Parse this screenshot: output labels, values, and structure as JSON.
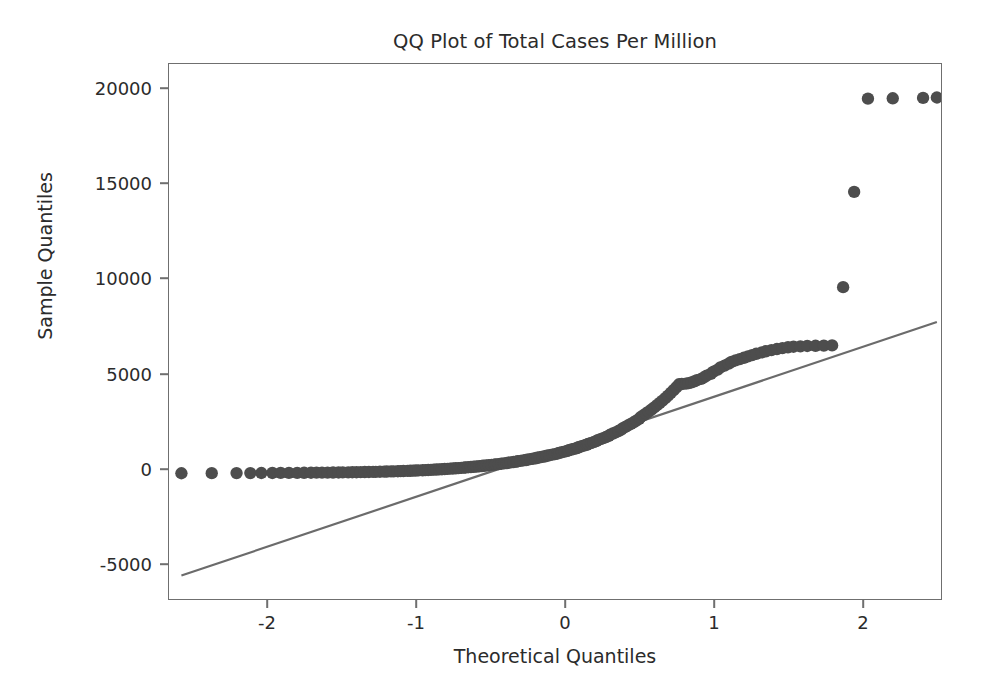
{
  "chart_data": {
    "type": "scatter",
    "title": "QQ Plot of Total Cases Per Million",
    "xlabel": "Theoretical Quantiles",
    "ylabel": "Sample Quantiles",
    "xlim": [
      -2.78,
      2.82
    ],
    "ylim": [
      -6600,
      21500
    ],
    "grid": false,
    "legend": null,
    "marker_color": "#4d4d4d",
    "line_color": "#6b6b6b",
    "xticks": [
      -2,
      -1,
      0,
      1,
      2
    ],
    "xtick_labels": [
      "-2",
      "-1",
      "0",
      "1",
      "2"
    ],
    "yticks": [
      -5000,
      0,
      5000,
      10000,
      15000,
      20000
    ],
    "ytick_labels": [
      "-5000",
      "0",
      "5000",
      "10000",
      "15000",
      "20000"
    ],
    "reference_line": {
      "name": "45-degree fit line",
      "x": [
        -2.69,
        2.79
      ],
      "y": [
        -5370,
        7950
      ]
    },
    "series": [
      {
        "name": "Sample quantiles",
        "x": [
          -2.69,
          -2.47,
          -2.29,
          -2.19,
          -2.11,
          -2.03,
          -1.97,
          -1.91,
          -1.85,
          -1.8,
          -1.75,
          -1.71,
          -1.67,
          -1.63,
          -1.59,
          -1.55,
          -1.52,
          -1.48,
          -1.45,
          -1.42,
          -1.39,
          -1.36,
          -1.33,
          -1.3,
          -1.28,
          -1.25,
          -1.22,
          -1.2,
          -1.17,
          -1.15,
          -1.12,
          -1.1,
          -1.08,
          -1.05,
          -1.03,
          -1.01,
          -0.99,
          -0.97,
          -0.94,
          -0.92,
          -0.9,
          -0.88,
          -0.86,
          -0.84,
          -0.82,
          -0.8,
          -0.78,
          -0.76,
          -0.74,
          -0.72,
          -0.7,
          -0.68,
          -0.66,
          -0.64,
          -0.63,
          -0.61,
          -0.59,
          -0.57,
          -0.55,
          -0.53,
          -0.51,
          -0.5,
          -0.48,
          -0.46,
          -0.44,
          -0.42,
          -0.41,
          -0.39,
          -0.37,
          -0.35,
          -0.33,
          -0.32,
          -0.3,
          -0.28,
          -0.26,
          -0.25,
          -0.23,
          -0.21,
          -0.19,
          -0.18,
          -0.16,
          -0.14,
          -0.12,
          -0.11,
          -0.09,
          -0.07,
          -0.05,
          -0.04,
          -0.02,
          0.0,
          0.02,
          0.04,
          0.05,
          0.07,
          0.09,
          0.11,
          0.12,
          0.14,
          0.16,
          0.18,
          0.19,
          0.21,
          0.23,
          0.25,
          0.26,
          0.28,
          0.3,
          0.32,
          0.33,
          0.35,
          0.37,
          0.39,
          0.41,
          0.42,
          0.44,
          0.46,
          0.48,
          0.5,
          0.51,
          0.53,
          0.55,
          0.57,
          0.59,
          0.61,
          0.63,
          0.64,
          0.66,
          0.68,
          0.7,
          0.72,
          0.74,
          0.76,
          0.78,
          0.8,
          0.82,
          0.84,
          0.86,
          0.88,
          0.9,
          0.92,
          0.94,
          0.97,
          0.99,
          1.01,
          1.03,
          1.05,
          1.08,
          1.1,
          1.12,
          1.15,
          1.17,
          1.2,
          1.22,
          1.25,
          1.28,
          1.3,
          1.33,
          1.36,
          1.39,
          1.42,
          1.45,
          1.48,
          1.52,
          1.55,
          1.59,
          1.63,
          1.67,
          1.71,
          1.75,
          1.8,
          1.85,
          1.91,
          1.97,
          2.03,
          2.11,
          2.19,
          2.29,
          2.47,
          2.69,
          2.79
        ],
        "y": [
          5,
          8,
          12,
          15,
          18,
          20,
          22,
          25,
          27,
          30,
          32,
          35,
          38,
          40,
          43,
          46,
          50,
          53,
          57,
          60,
          64,
          68,
          72,
          76,
          80,
          85,
          90,
          95,
          100,
          105,
          110,
          116,
          122,
          128,
          134,
          140,
          147,
          154,
          161,
          168,
          176,
          184,
          192,
          200,
          208,
          217,
          226,
          235,
          245,
          255,
          265,
          275,
          286,
          297,
          308,
          320,
          332,
          344,
          357,
          370,
          383,
          397,
          411,
          426,
          441,
          456,
          472,
          488,
          505,
          522,
          540,
          558,
          576,
          595,
          615,
          635,
          656,
          677,
          699,
          721,
          744,
          768,
          792,
          817,
          843,
          869,
          896,
          924,
          952,
          982,
          1012,
          1043,
          1075,
          1108,
          1142,
          1177,
          1213,
          1250,
          1288,
          1327,
          1368,
          1410,
          1453,
          1497,
          1543,
          1590,
          1639,
          1689,
          1741,
          1795,
          1850,
          1907,
          1966,
          2027,
          2090,
          2155,
          2222,
          2292,
          2364,
          2439,
          2516,
          2596,
          2679,
          2765,
          2854,
          2946,
          3042,
          3141,
          3244,
          3351,
          3462,
          3577,
          3697,
          3821,
          3950,
          4084,
          4224,
          4369,
          4520,
          4677,
          4690,
          4710,
          4740,
          4780,
          4830,
          4890,
          4960,
          5040,
          5130,
          5230,
          5340,
          5450,
          5560,
          5660,
          5760,
          5850,
          5930,
          6000,
          6070,
          6140,
          6210,
          6280,
          6350,
          6410,
          6470,
          6530,
          6580,
          6620,
          6650,
          6670,
          6690,
          6700,
          6710,
          6720,
          9780,
          14780,
          19680,
          19700,
          19720,
          19740
        ]
      }
    ],
    "outliers": [
      {
        "label": "extreme-high-1",
        "x": 2.11,
        "y": 9780
      },
      {
        "label": "extreme-high-2",
        "x": 2.19,
        "y": 14780
      },
      {
        "label": "extreme-high-3",
        "x": 2.47,
        "y": 19680
      },
      {
        "label": "extreme-high-4",
        "x": 2.69,
        "y": 19700
      }
    ]
  },
  "figure": {
    "background": "#ffffff",
    "axes_edge_color": "#6f6f6f"
  }
}
